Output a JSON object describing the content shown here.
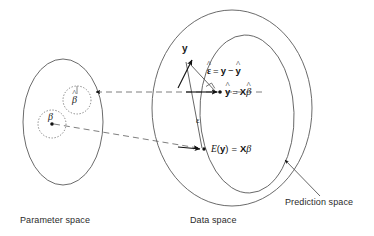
{
  "figure": {
    "background_color": "#ffffff",
    "stroke_color": "#4a4a4a",
    "text_color": "#1a1a1a"
  },
  "spaces": {
    "parameter": {
      "caption": "Parameter space",
      "beta_hat_label": "β",
      "beta_hat_accent": "^",
      "beta_label": "β"
    },
    "data": {
      "caption": "Data space"
    },
    "prediction": {
      "caption": "Prediction space"
    }
  },
  "vectors": {
    "y_label": "y",
    "epsilon_label": "ε",
    "residual_equation": {
      "lhs_symbol": "ε",
      "lhs_accent": "^",
      "equals": "=",
      "rhs_first": "y",
      "minus": "−",
      "rhs_second": "y",
      "rhs_second_accent": "^",
      "full_text": "ε̂ = y − ŷ"
    },
    "fitted_equation": {
      "lhs_symbol": "y",
      "lhs_accent": "^",
      "equals": "=",
      "matrix": "X",
      "coefficient": "β",
      "coefficient_accent": "^",
      "full_text": "ŷ = Xβ̂"
    },
    "expectation_equation": {
      "operator": "E",
      "open_paren": "(",
      "argument": "y",
      "close_paren": ")",
      "equals": "=",
      "matrix": "X",
      "coefficient": "β",
      "full_text": "E(y) = Xβ"
    }
  },
  "annotations": {
    "right_angle_marker": "right-angle",
    "dashed_mapping_upper": "beta-hat-to-y-hat mapping",
    "dashed_mapping_lower": "beta-to-E-y mapping"
  }
}
